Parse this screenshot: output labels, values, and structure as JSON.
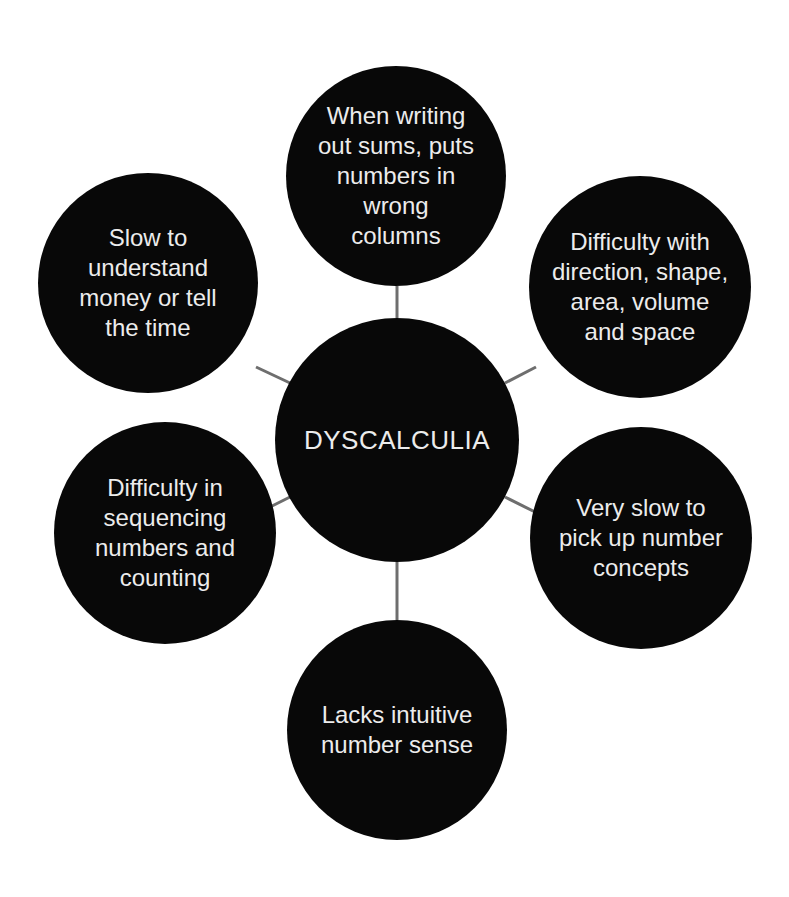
{
  "diagram": {
    "title": "DYSCALCULIA",
    "colors": {
      "background": "#ffffff",
      "node_fill": "#080808",
      "node_text": "#ececec",
      "connector": "#6e6e6e"
    },
    "center": {
      "label": "DYSCALCULIA",
      "cx": 397,
      "cy": 440,
      "r": 122
    },
    "nodes": [
      {
        "id": "top",
        "label": "When writing\nout sums, puts\nnumbers in\nwrong\ncolumns",
        "cx": 396,
        "cy": 176,
        "r": 110
      },
      {
        "id": "upper-right",
        "label": "Difficulty with\ndirection, shape,\narea, volume\nand space",
        "cx": 640,
        "cy": 287,
        "r": 111
      },
      {
        "id": "lower-right",
        "label": "Very slow to\npick up number\nconcepts",
        "cx": 641,
        "cy": 538,
        "r": 111
      },
      {
        "id": "bottom",
        "label": "Lacks intuitive\nnumber sense",
        "cx": 397,
        "cy": 730,
        "r": 110
      },
      {
        "id": "lower-left",
        "label": "Difficulty in\nsequencing\nnumbers and\ncounting",
        "cx": 165,
        "cy": 533,
        "r": 111
      },
      {
        "id": "upper-left",
        "label": "Slow to\nunderstand\nmoney or tell\nthe time",
        "cx": 148,
        "cy": 283,
        "r": 110
      }
    ]
  }
}
